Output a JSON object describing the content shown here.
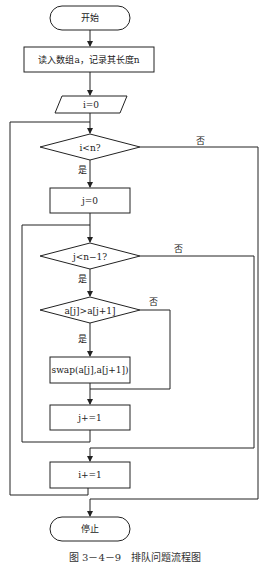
{
  "diagram": {
    "type": "flowchart",
    "nodes": {
      "start": "开始",
      "read_input": "读入数组a，记录其长度n",
      "init_i": "i=0",
      "cond_i": "i<n?",
      "init_j": "j=0",
      "cond_j": "j<n−1?",
      "cond_compare": "a[j]>a[j+1]",
      "swap": "swap(a[j],a[j+1])",
      "inc_j": "j+=1",
      "inc_i": "i+=1",
      "stop": "停止"
    },
    "edge_labels": {
      "cond_i_yes": "是",
      "cond_i_no": "否",
      "cond_j_yes": "是",
      "cond_j_no": "否",
      "cond_compare_yes": "是",
      "cond_compare_no": "否"
    },
    "caption": "图 3－4－9　排队问题流程图",
    "colors": {
      "line": "#222222",
      "background": "#ffffff"
    }
  }
}
